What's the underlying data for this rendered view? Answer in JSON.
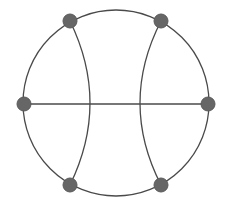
{
  "diagram": {
    "type": "graph",
    "colors": {
      "background": "#ffffff",
      "edge": "#4a4a4a",
      "node_fill": "#666666",
      "node_stroke": "#5a5a5a"
    },
    "outer_circle": {
      "cx": 116,
      "cy": 103,
      "r": 93
    },
    "nodes": [
      {
        "id": "top-left",
        "x": 70,
        "y": 21
      },
      {
        "id": "top-right",
        "x": 161,
        "y": 21
      },
      {
        "id": "left",
        "x": 24,
        "y": 104
      },
      {
        "id": "right",
        "x": 208,
        "y": 104
      },
      {
        "id": "bottom-left",
        "x": 70,
        "y": 185
      },
      {
        "id": "bottom-right",
        "x": 161,
        "y": 185
      }
    ],
    "node_radius": 7,
    "edges": [
      {
        "from": "left",
        "to": "right",
        "shape": "line"
      },
      {
        "from": "top-left",
        "to": "bottom-left",
        "shape": "arc",
        "mid_x": 90
      },
      {
        "from": "top-right",
        "to": "bottom-right",
        "shape": "arc",
        "mid_x": 140
      }
    ]
  }
}
